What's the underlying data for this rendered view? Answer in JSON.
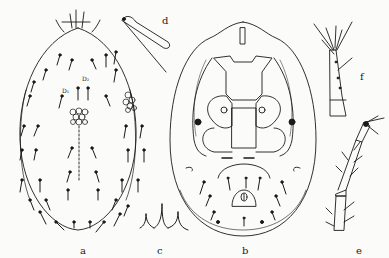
{
  "figure": {
    "panels": [
      {
        "id": "a",
        "label": "a",
        "description": "dorsal view of mite body"
      },
      {
        "id": "b",
        "label": "b",
        "description": "ventral view of mite body"
      },
      {
        "id": "c",
        "label": "c",
        "description": "setae detail"
      },
      {
        "id": "d",
        "label": "d",
        "description": "chelicera / palp detail"
      },
      {
        "id": "e",
        "label": "e",
        "description": "leg segment detail"
      },
      {
        "id": "f",
        "label": "f",
        "description": "tarsus detail"
      }
    ],
    "setae_labels": [
      "D₁",
      "D₂"
    ],
    "line_color": "#1a1a1a",
    "background": "#fbfbfa"
  }
}
